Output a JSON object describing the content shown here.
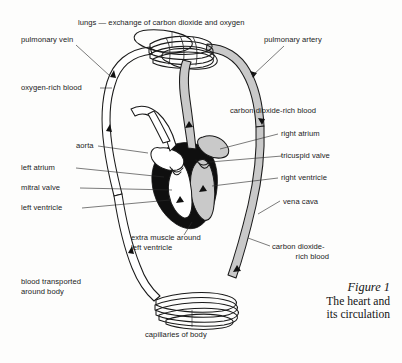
{
  "figure": {
    "number_label": "Figure 1",
    "caption_line1": "The heart and",
    "caption_line2": "its circulation"
  },
  "colors": {
    "ink": "#1a1a1a",
    "paper": "#fdfdfc",
    "deoxygenated_fill": "#c9c9c9",
    "oxygenated_fill": "#ffffff",
    "muscle_fill": "#101010",
    "leader_line": "#2b2b2b"
  },
  "labels": {
    "lungs": "lungs — exchange of carbon dioxide and oxygen",
    "pulmonary_vein": "pulmonary vein",
    "pulmonary_artery": "pulmonary artery",
    "oxygen_rich_blood": "oxygen-rich blood",
    "carbon_dioxide_rich_blood": "carbon dioxide-rich blood",
    "aorta": "aorta",
    "right_atrium": "right atrium",
    "tricuspid_valve": "tricuspid valve",
    "left_atrium": "left atrium",
    "mitral_valve": "mitral valve",
    "right_ventricle": "right ventricle",
    "left_ventricle": "left ventricle",
    "vena_cava": "vena cava",
    "extra_muscle_line1": "extra muscle around",
    "extra_muscle_line2": "left ventricle",
    "carbon_dioxide_rich_blood_low_line1": "carbon dioxide-",
    "carbon_dioxide_rich_blood_low_line2": "rich blood",
    "blood_transported_line1": "blood transported",
    "blood_transported_line2": "around body",
    "capillaries_of_body": "capillaries of body"
  },
  "diagram_parts": [
    "lungs",
    "pulmonary-vein-vessel",
    "pulmonary-artery-vessel",
    "aorta-arch",
    "vena-cava-vessel",
    "heart",
    "left-ventricle-muscle",
    "right-atrium-chamber",
    "right-ventricle-chamber",
    "left-atrium-chamber",
    "left-ventricle-chamber",
    "tricuspid-valve",
    "mitral-valve",
    "body-capillaries",
    "flow-arrows"
  ]
}
